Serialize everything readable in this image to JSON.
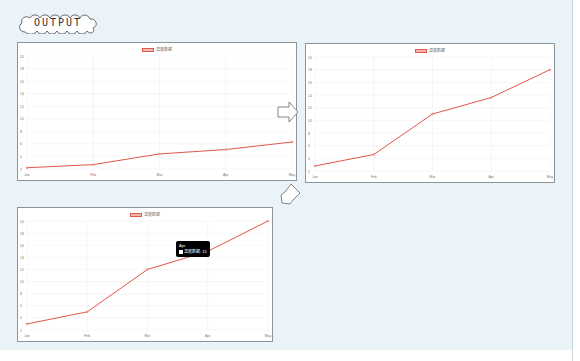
{
  "header": {
    "label": "OUTPUT"
  },
  "colors": {
    "line": "#e0574c",
    "fill": "#f4b9b4",
    "grid": "#ececec",
    "background": "#eaf3f7"
  },
  "icons": {
    "arrow_right": "arrow-right-icon",
    "arrow_down_left": "arrow-down-left-icon"
  },
  "chart_data": [
    {
      "type": "line",
      "title": "",
      "categories": [
        "Jan",
        "Feb",
        "Mar",
        "Apr",
        "May"
      ],
      "series": [
        {
          "name": "温度数据",
          "values": [
            2.2,
            2.7,
            4.4,
            5.1,
            6.3
          ]
        }
      ],
      "yticks": [
        2,
        4,
        6,
        8,
        10,
        12,
        14,
        16,
        18,
        20
      ],
      "ylim": [
        2,
        20
      ],
      "grid": true,
      "legend_position": "top"
    },
    {
      "type": "line",
      "title": "",
      "categories": [
        "Jan",
        "Feb",
        "Mar",
        "Apr",
        "May"
      ],
      "series": [
        {
          "name": "温度数据",
          "values": [
            2.8,
            4.6,
            11,
            13.6,
            18
          ]
        }
      ],
      "yticks": [
        2,
        4,
        6,
        8,
        10,
        12,
        14,
        16,
        18,
        20
      ],
      "ylim": [
        2,
        20
      ],
      "grid": true,
      "legend_position": "top"
    },
    {
      "type": "line",
      "title": "",
      "categories": [
        "Jan",
        "Feb",
        "Mar",
        "Apr",
        "May"
      ],
      "series": [
        {
          "name": "温度数据",
          "values": [
            3,
            5,
            12,
            15,
            20
          ]
        }
      ],
      "yticks": [
        2,
        4,
        6,
        8,
        10,
        12,
        14,
        16,
        18,
        20
      ],
      "ylim": [
        2,
        20
      ],
      "grid": true,
      "legend_position": "top",
      "tooltip": {
        "title": "Apr",
        "label": "温度数据",
        "value": "15"
      }
    }
  ]
}
